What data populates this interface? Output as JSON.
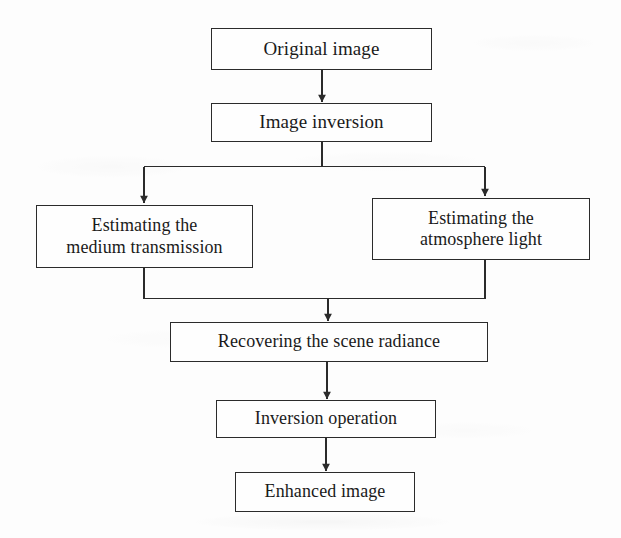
{
  "diagram": {
    "type": "flowchart",
    "orientation": "top-to-bottom",
    "stroke_color": "#2b2b2b",
    "node_fill": "#fefefe",
    "background": "#fdfdfd",
    "nodes": [
      {
        "id": "original",
        "label": "Original image"
      },
      {
        "id": "inversion",
        "label": "Image inversion"
      },
      {
        "id": "medium",
        "label": "Estimating the\nmedium transmission"
      },
      {
        "id": "atmosphere",
        "label": "Estimating the\natmosphere light"
      },
      {
        "id": "recovering",
        "label": "Recovering the scene radiance"
      },
      {
        "id": "invop",
        "label": "Inversion operation"
      },
      {
        "id": "enhanced",
        "label": "Enhanced image"
      }
    ],
    "edges": [
      {
        "from": "original",
        "to": "inversion",
        "style": "straight-arrow"
      },
      {
        "from": "inversion",
        "to": "medium",
        "style": "split-left-arrow"
      },
      {
        "from": "inversion",
        "to": "atmosphere",
        "style": "split-right-arrow"
      },
      {
        "from": "medium",
        "to": "recovering",
        "style": "merge-left"
      },
      {
        "from": "atmosphere",
        "to": "recovering",
        "style": "merge-right"
      },
      {
        "from": "recovering",
        "to": "invop",
        "style": "straight-arrow"
      },
      {
        "from": "invop",
        "to": "enhanced",
        "style": "straight-arrow"
      }
    ]
  }
}
